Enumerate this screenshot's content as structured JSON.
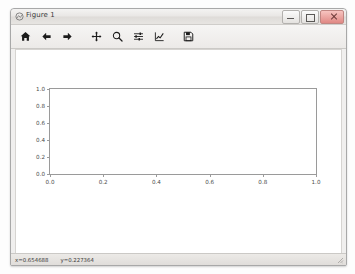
{
  "window": {
    "title": "Figure 1",
    "icon": "figure-window-icon",
    "controls": [
      {
        "name": "minimize",
        "label": "–"
      },
      {
        "name": "maximize",
        "label": "□"
      },
      {
        "name": "close",
        "label": "✕"
      }
    ]
  },
  "toolbar": {
    "buttons": [
      {
        "name": "home-icon",
        "tooltip": "Reset original view"
      },
      {
        "name": "back-arrow-icon",
        "tooltip": "Back to previous view"
      },
      {
        "name": "forward-arrow-icon",
        "tooltip": "Forward to next view"
      },
      {
        "name": "pan-move-icon",
        "tooltip": "Pan axes with left mouse, zoom with right"
      },
      {
        "name": "zoom-magnifier-icon",
        "tooltip": "Zoom to rectangle"
      },
      {
        "name": "subplot-config-icon",
        "tooltip": "Configure subplots"
      },
      {
        "name": "edit-curve-icon",
        "tooltip": "Edit axis, curve and image parameters"
      },
      {
        "name": "save-floppy-icon",
        "tooltip": "Save the figure"
      }
    ]
  },
  "status": {
    "x_coord": "x=0.654688",
    "y_coord": "y=0.227364"
  },
  "colors": {
    "axis": "#9a9a9a",
    "tick_text": "#4a4a4a",
    "canvas": "#ffffff",
    "chrome": "#f0efee"
  },
  "chart_data": {
    "type": "line",
    "title": "",
    "xlabel": "",
    "ylabel": "",
    "xlim": [
      0.0,
      1.0
    ],
    "ylim": [
      0.0,
      1.0
    ],
    "xticks": [
      "0.0",
      "0.2",
      "0.4",
      "0.6",
      "0.8",
      "1.0"
    ],
    "xtick_values": [
      0.0,
      0.2,
      0.4,
      0.6,
      0.8,
      1.0
    ],
    "yticks": [
      "0.0",
      "0.2",
      "0.4",
      "0.6",
      "0.8",
      "1.0"
    ],
    "ytick_values": [
      0.0,
      0.2,
      0.4,
      0.6,
      0.8,
      1.0
    ],
    "series": [],
    "grid": false,
    "legend": false,
    "note": "empty default matplotlib axes; no data plotted"
  }
}
